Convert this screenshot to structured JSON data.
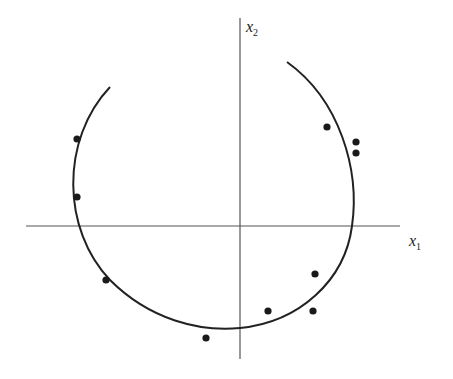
{
  "diagram": {
    "x_axis": {
      "label": "x",
      "subscript": "1",
      "from": [
        26,
        226
      ],
      "to": [
        400,
        226
      ]
    },
    "y_axis": {
      "label": "x",
      "subscript": "2",
      "from": [
        240,
        18
      ],
      "to": [
        240,
        359
      ]
    },
    "circle_arc": {
      "center": [
        218,
        190
      ],
      "radius": 140,
      "path": "M 110 87 C 60 140, 62 230, 110 280 C 150 320, 200 332, 240 328 C 300 322, 345 280, 352 226 C 360 170, 340 100, 287 62"
    },
    "points": [
      [
        77,
        139
      ],
      [
        77,
        197
      ],
      [
        106,
        280
      ],
      [
        206,
        338
      ],
      [
        268,
        311
      ],
      [
        313,
        311
      ],
      [
        315,
        274
      ],
      [
        327,
        127
      ],
      [
        356,
        142
      ],
      [
        356,
        153
      ]
    ],
    "colors": {
      "line": "#222222",
      "point": "#1a1a1a",
      "axis": "#555555"
    }
  }
}
